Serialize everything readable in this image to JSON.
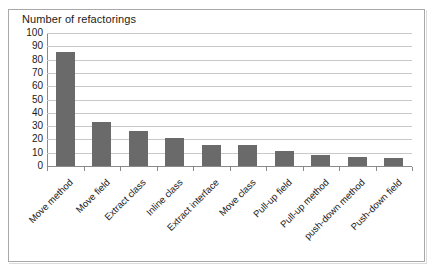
{
  "chart_data": {
    "type": "bar",
    "title": "Number of refactorings",
    "xlabel": "",
    "ylabel": "Number of refactorings",
    "ylim": [
      0,
      100
    ],
    "ytick_labels": [
      "100",
      "90",
      "80",
      "70",
      "60",
      "50",
      "40",
      "30",
      "20",
      "10",
      "0"
    ],
    "ytick_values": [
      100,
      90,
      80,
      70,
      60,
      50,
      40,
      30,
      20,
      10,
      0
    ],
    "grid": true,
    "legend": "none",
    "bar_color": "#6a6a6a",
    "gridline_color": "#c9c9c9",
    "axis_color": "#8a8a8a",
    "categories": [
      "Move method",
      "Move field",
      "Extract class",
      "Inline class",
      "Extract interface",
      "Move class",
      "Pull-up field",
      "Pull-up method",
      "push-down method",
      "Push-down field"
    ],
    "values": [
      86,
      33,
      26,
      21,
      16,
      16,
      11,
      8,
      7,
      6
    ]
  }
}
